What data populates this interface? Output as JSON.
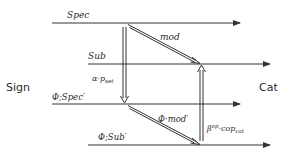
{
  "diagram": {
    "type": "commutative-diagram",
    "side_labels": {
      "left": "Sign",
      "right": "Cat"
    },
    "horizontal_arrows": [
      {
        "label": "Spec",
        "row": 1
      },
      {
        "label": "Sub",
        "row": 2
      },
      {
        "label": "Φ;Spec′",
        "row": 3
      },
      {
        "label": "Φ;Sub′",
        "row": 4
      }
    ],
    "double_arrows": [
      {
        "label": "mod",
        "from": "Spec",
        "to": "Sub",
        "direction": "diagonal-down"
      },
      {
        "label": "Φ·mod′",
        "from": "Φ;Spec′",
        "to": "Φ;Sub′",
        "direction": "diagonal-down"
      },
      {
        "label": "α·p_set",
        "label_main": "α·p",
        "label_sub": "set",
        "from": "Spec",
        "to": "Φ;Spec′",
        "direction": "down"
      },
      {
        "label": "β^op·cop_cat",
        "label_main": "β",
        "label_sup": "op",
        "label_mid": "·cop",
        "label_sub": "cat",
        "from": "Φ;Sub′",
        "to": "Sub",
        "direction": "up"
      }
    ],
    "colors": {
      "line": "#333333",
      "text": "#2a2a2a",
      "background": "#ffffff"
    }
  }
}
